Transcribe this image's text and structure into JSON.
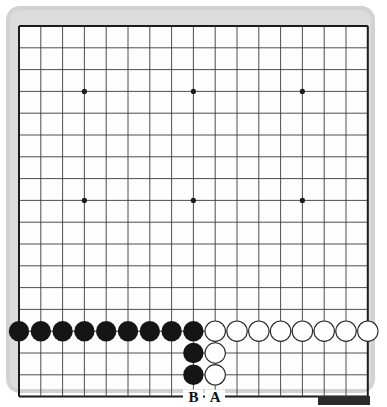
{
  "figure": {
    "name": "go-board-diagram",
    "type": "go-board-position",
    "board": {
      "columns": 17,
      "rows": 18,
      "origin_x": 19,
      "origin_y": 26,
      "spacing": 21.8,
      "line_color": "#3a3a3a",
      "border_color": "#1c1c1c",
      "surface_color": "#fdfdfd",
      "frame_color": "#d2d2d2",
      "frame_inner_color": "#dcdcdc"
    },
    "star_points": [
      {
        "col": 3,
        "row": 3
      },
      {
        "col": 8,
        "row": 3
      },
      {
        "col": 13,
        "row": 3
      },
      {
        "col": 3,
        "row": 8
      },
      {
        "col": 8,
        "row": 8
      },
      {
        "col": 13,
        "row": 8
      }
    ],
    "stones": {
      "black_color": "#151515",
      "white_color": "#ffffff",
      "white_outline_color": "#2a2a2a",
      "radius": 10.2,
      "black": [
        {
          "col": 0,
          "row": 14
        },
        {
          "col": 1,
          "row": 14
        },
        {
          "col": 2,
          "row": 14
        },
        {
          "col": 3,
          "row": 14
        },
        {
          "col": 4,
          "row": 14
        },
        {
          "col": 5,
          "row": 14
        },
        {
          "col": 6,
          "row": 14
        },
        {
          "col": 7,
          "row": 14
        },
        {
          "col": 8,
          "row": 14
        },
        {
          "col": 8,
          "row": 15
        },
        {
          "col": 8,
          "row": 16
        }
      ],
      "white": [
        {
          "col": 9,
          "row": 14
        },
        {
          "col": 10,
          "row": 14
        },
        {
          "col": 11,
          "row": 14
        },
        {
          "col": 12,
          "row": 14
        },
        {
          "col": 13,
          "row": 14
        },
        {
          "col": 14,
          "row": 14
        },
        {
          "col": 15,
          "row": 14
        },
        {
          "col": 16,
          "row": 14
        },
        {
          "col": 9,
          "row": 15
        },
        {
          "col": 9,
          "row": 16
        }
      ]
    },
    "labels": [
      {
        "text": "B",
        "col": 8,
        "row": 17,
        "name": "point-label-b"
      },
      {
        "text": "A",
        "col": 9,
        "row": 17,
        "name": "point-label-a"
      }
    ],
    "bottom_tab": {
      "color": "#2b2b2b",
      "x": 318,
      "y": 396,
      "width": 52,
      "height": 9
    }
  }
}
